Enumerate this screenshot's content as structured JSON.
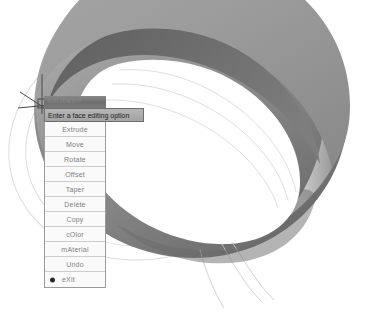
{
  "app": {
    "background_color": "#ffffff",
    "canvas_width": 378,
    "canvas_height": 314
  },
  "model": {
    "name": "shaded-3d-torus-solid",
    "description": "Shaded isometric 3D ring / torus solid with highlighted face",
    "top_face_color": "#9a9a9a",
    "inner_face_color": "#6f6f6f",
    "outer_face_color": "#8e8e8e",
    "highlight_color": "#cfcfcf",
    "shadow_color": "#5e5e5e",
    "wireframe_color": "#d8d8d8",
    "hole_color": "#ffffff"
  },
  "cursor": {
    "type": "crosshair-pickbox",
    "color": "#4a4a4a",
    "x": 42,
    "y": 103
  },
  "menu": {
    "capstrip_ghost_text": "SOLIDEDIT",
    "header_label": "Enter a face editing option",
    "selected_index": 10,
    "items": [
      {
        "label": "Extrude",
        "marker": false
      },
      {
        "label": "Move",
        "marker": false
      },
      {
        "label": "Rotate",
        "marker": false
      },
      {
        "label": "Offset",
        "marker": false
      },
      {
        "label": "Taper",
        "marker": false
      },
      {
        "label": "Delete",
        "marker": false
      },
      {
        "label": "Copy",
        "marker": false
      },
      {
        "label": "cOlor",
        "marker": false
      },
      {
        "label": "mAterial",
        "marker": false
      },
      {
        "label": "Undo",
        "marker": false
      },
      {
        "label": "eXit",
        "marker": true
      }
    ]
  }
}
